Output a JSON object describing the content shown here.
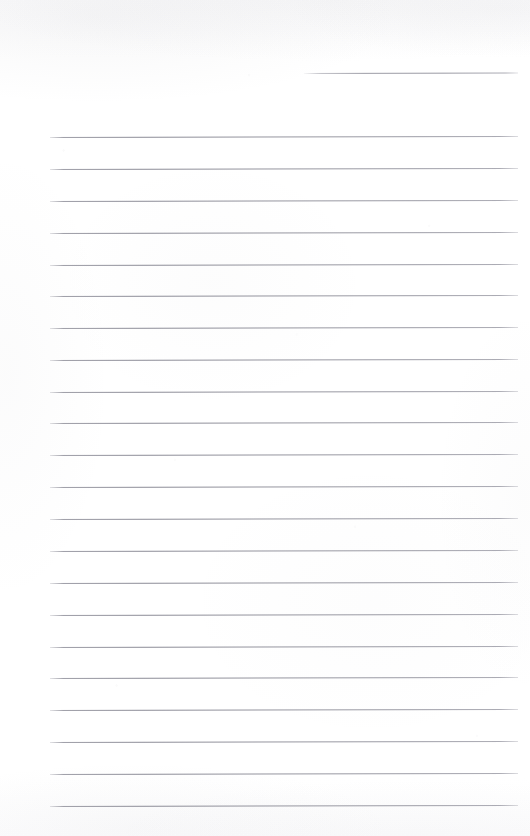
{
  "document": {
    "kind": "scanned-blank-ruled-notebook-page",
    "title": "Blank Ruled Notebook Page",
    "page_width": 530,
    "page_height": 836,
    "background_color": "#ffffff",
    "rule_color": "#92929c",
    "body_text": "",
    "handwriting": "",
    "printed_text": "",
    "page_number": "",
    "header_text": "",
    "footer_text": "",
    "margin_rule": "none",
    "rule_count": 22,
    "rule_spacing_px": 31.9,
    "rule_left_px": 50,
    "rule_right_px": 518,
    "rule_tilt_deg": -0.12
  },
  "rules": [
    {
      "id": 1,
      "y": 73.0,
      "x_start": 304,
      "x_end": 518,
      "partial": true,
      "label": "rule-line-1-partial"
    },
    {
      "id": 2,
      "y": 136.7,
      "x_start": 50,
      "x_end": 518,
      "partial": false,
      "label": "rule-line-2"
    },
    {
      "id": 3,
      "y": 169.3,
      "x_start": 50,
      "x_end": 518,
      "partial": false,
      "label": "rule-line-3"
    },
    {
      "id": 4,
      "y": 201.0,
      "x_start": 50,
      "x_end": 518,
      "partial": false,
      "label": "rule-line-4"
    },
    {
      "id": 5,
      "y": 232.7,
      "x_start": 50,
      "x_end": 518,
      "partial": false,
      "label": "rule-line-5"
    },
    {
      "id": 6,
      "y": 264.7,
      "x_start": 50,
      "x_end": 518,
      "partial": false,
      "label": "rule-line-6"
    },
    {
      "id": 7,
      "y": 296.3,
      "x_start": 50,
      "x_end": 518,
      "partial": false,
      "label": "rule-line-7"
    },
    {
      "id": 8,
      "y": 328.3,
      "x_start": 50,
      "x_end": 518,
      "partial": false,
      "label": "rule-line-8"
    },
    {
      "id": 9,
      "y": 360.0,
      "x_start": 50,
      "x_end": 518,
      "partial": false,
      "label": "rule-line-9"
    },
    {
      "id": 10,
      "y": 391.7,
      "x_start": 50,
      "x_end": 518,
      "partial": false,
      "label": "rule-line-10"
    },
    {
      "id": 11,
      "y": 422.7,
      "x_start": 50,
      "x_end": 518,
      "partial": false,
      "label": "rule-line-11"
    },
    {
      "id": 12,
      "y": 455.0,
      "x_start": 50,
      "x_end": 518,
      "partial": false,
      "label": "rule-line-12"
    },
    {
      "id": 13,
      "y": 486.7,
      "x_start": 50,
      "x_end": 518,
      "partial": false,
      "label": "rule-line-13"
    },
    {
      "id": 14,
      "y": 519.0,
      "x_start": 50,
      "x_end": 518,
      "partial": false,
      "label": "rule-line-14"
    },
    {
      "id": 15,
      "y": 550.7,
      "x_start": 50,
      "x_end": 518,
      "partial": false,
      "label": "rule-line-15"
    },
    {
      "id": 16,
      "y": 582.7,
      "x_start": 50,
      "x_end": 518,
      "partial": false,
      "label": "rule-line-16"
    },
    {
      "id": 17,
      "y": 614.7,
      "x_start": 50,
      "x_end": 518,
      "partial": false,
      "label": "rule-line-17"
    },
    {
      "id": 18,
      "y": 646.7,
      "x_start": 50,
      "x_end": 518,
      "partial": false,
      "label": "rule-line-18"
    },
    {
      "id": 19,
      "y": 678.3,
      "x_start": 50,
      "x_end": 518,
      "partial": false,
      "label": "rule-line-19"
    },
    {
      "id": 20,
      "y": 710.0,
      "x_start": 50,
      "x_end": 518,
      "partial": false,
      "label": "rule-line-20"
    },
    {
      "id": 21,
      "y": 742.0,
      "x_start": 50,
      "x_end": 518,
      "partial": false,
      "label": "rule-line-21"
    },
    {
      "id": 22,
      "y": 774.0,
      "x_start": 50,
      "x_end": 518,
      "partial": false,
      "label": "rule-line-22"
    },
    {
      "id": 23,
      "y": 806.0,
      "x_start": 50,
      "x_end": 518,
      "partial": false,
      "label": "rule-line-23"
    }
  ]
}
